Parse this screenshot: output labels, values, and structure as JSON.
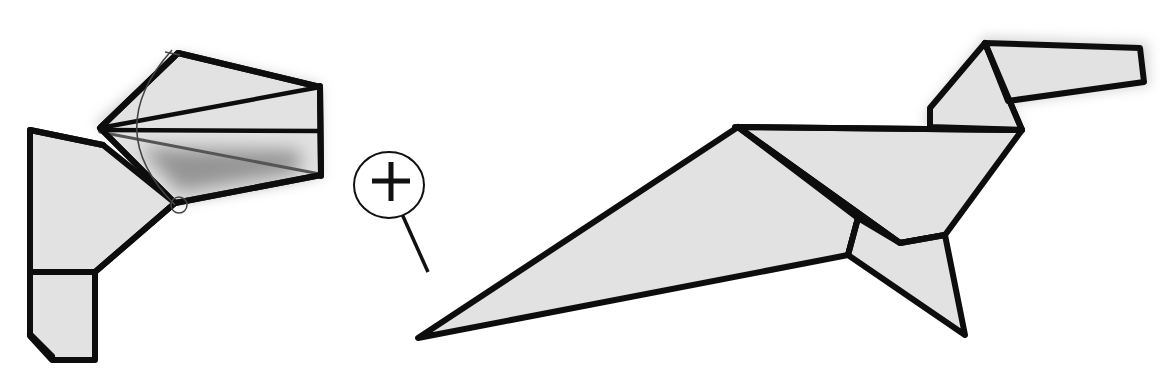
{
  "diagram": {
    "type": "origami-instruction-step",
    "colors": {
      "paper": "#e2e2e2",
      "outline": "#0d0d0d",
      "shadow": "#8a8a8a",
      "background": "#ffffff"
    },
    "panels": [
      {
        "id": "detail-view",
        "description": "Close-up of head being folded: fan of creases with an arc arrow indicating a swivel fold, and a small circle marking the pivot point",
        "elements": [
          "head-fan",
          "neck-body-edge",
          "swivel-arc",
          "pivot-circle",
          "shadow-under-fold"
        ]
      },
      {
        "id": "magnify-symbol",
        "description": "Magnifying glass with plus sign indicating the detail view is enlarged",
        "symbol": "+"
      },
      {
        "id": "result-view",
        "description": "Completed origami dinosaur silhouette with head, neck, body, leg and tail",
        "elements": [
          "head",
          "neck",
          "body",
          "leg",
          "tail"
        ]
      }
    ]
  }
}
